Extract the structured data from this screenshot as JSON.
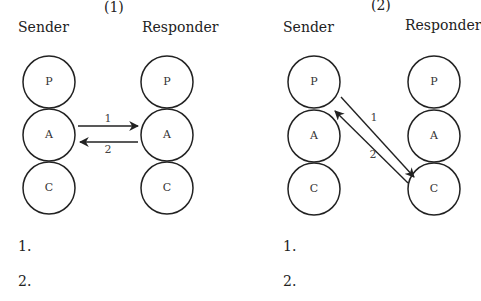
{
  "diagrams": [
    {
      "number": "(1)",
      "sender_label": "Sender",
      "responder_label": "Responder",
      "sender_states": [
        "P",
        "A",
        "C"
      ],
      "responder_states": [
        "P",
        "A",
        "C"
      ],
      "transactions": [
        {
          "label": "1",
          "from": "Sender A",
          "to": "Responder A"
        },
        {
          "label": "2",
          "from": "Responder A",
          "to": "Sender A"
        }
      ],
      "answer_lines": [
        "1.",
        "2."
      ]
    },
    {
      "number": "(2)",
      "sender_label": "Sender",
      "responder_label": "Responder",
      "sender_states": [
        "P",
        "A",
        "C"
      ],
      "responder_states": [
        "P",
        "A",
        "C"
      ],
      "transactions": [
        {
          "label": "1",
          "from": "Sender P",
          "to": "Responder C"
        },
        {
          "label": "2",
          "from": "Responder C",
          "to": "Sender P"
        }
      ],
      "answer_lines": [
        "1.",
        "2."
      ]
    }
  ]
}
